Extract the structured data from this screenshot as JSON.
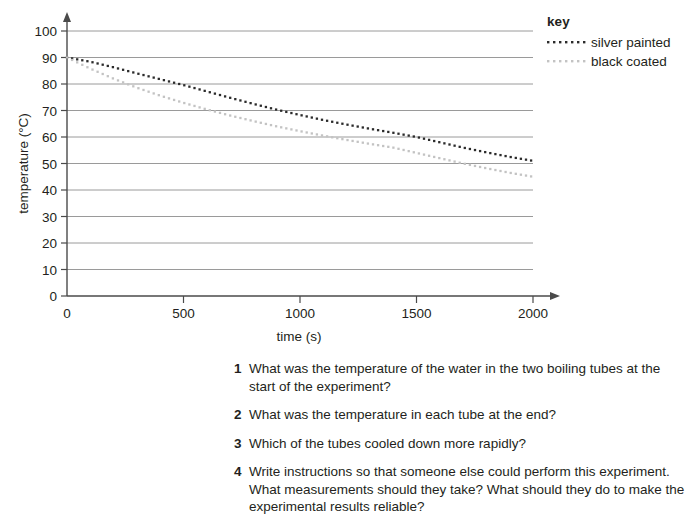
{
  "chart_data": {
    "type": "line",
    "title": "",
    "xlabel": "time (s)",
    "ylabel": "temperature (°C)",
    "xlim": [
      0,
      2000
    ],
    "ylim": [
      0,
      100
    ],
    "xticks": [
      0,
      500,
      1000,
      1500,
      2000
    ],
    "yticks": [
      0,
      10,
      20,
      30,
      40,
      50,
      60,
      70,
      80,
      90,
      100
    ],
    "xtick_labels": [
      "0",
      "500",
      "1000",
      "1500",
      "2000"
    ],
    "ytick_labels": [
      "0",
      "10",
      "20",
      "30",
      "40",
      "50",
      "60",
      "70",
      "80",
      "90",
      "100"
    ],
    "grid": "horizontal",
    "legend_position": "top-right",
    "legend_title": "key",
    "line_style": "dotted",
    "series": [
      {
        "name": "silver painted",
        "color": "#2b2b2b",
        "x": [
          0,
          100,
          200,
          300,
          400,
          500,
          600,
          700,
          800,
          900,
          1000,
          1100,
          1200,
          1300,
          1400,
          1500,
          1600,
          1700,
          1800,
          1900,
          2000
        ],
        "y": [
          90.0,
          88.4,
          86.3,
          84.0,
          81.8,
          79.6,
          77.2,
          74.8,
          72.5,
          70.3,
          68.3,
          66.4,
          64.7,
          63.1,
          61.6,
          60.0,
          58.0,
          56.0,
          54.2,
          52.5,
          51.0
        ]
      },
      {
        "name": "black coated",
        "color": "#c3c3c3",
        "x": [
          0,
          100,
          200,
          300,
          400,
          500,
          600,
          700,
          800,
          900,
          1000,
          1100,
          1200,
          1300,
          1400,
          1500,
          1600,
          1700,
          1800,
          1900,
          2000
        ],
        "y": [
          90.0,
          85.8,
          82.0,
          78.6,
          75.6,
          72.9,
          70.4,
          68.1,
          66.0,
          64.0,
          62.2,
          60.5,
          58.9,
          57.4,
          56.0,
          54.0,
          52.0,
          50.0,
          48.2,
          46.5,
          45.0
        ]
      }
    ]
  },
  "legend": {
    "title": "key",
    "entries": [
      {
        "label": "silver painted",
        "color": "#2b2b2b"
      },
      {
        "label": "black coated",
        "color": "#c3c3c3"
      }
    ]
  },
  "axes": {
    "x_label": "time (s)",
    "y_label": "temperature (°C)"
  },
  "questions": [
    {
      "number": "1",
      "text": "What was the temperature of the water in the two boiling tubes at the start of the experiment?"
    },
    {
      "number": "2",
      "text": "What was the temperature in each tube at the end?"
    },
    {
      "number": "3",
      "text": "Which of the tubes cooled down more rapidly?"
    },
    {
      "number": "4",
      "text": "Write instructions so that someone else could perform this experiment. What measurements should they take? What should they do to make the experimental results reliable?"
    }
  ]
}
